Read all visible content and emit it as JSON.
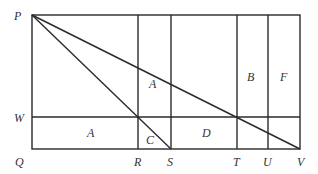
{
  "diagram": {
    "type": "geometry",
    "stroke_color": "#2a2a2a",
    "label_color": "#333333",
    "points": {
      "P": {
        "label": "P",
        "x": 32,
        "y": 15
      },
      "Q": {
        "label": "Q",
        "x": 32,
        "y": 149
      },
      "W": {
        "label": "W",
        "x": 32,
        "y": 117
      },
      "R": {
        "label": "R",
        "x": 138,
        "y": 149
      },
      "S": {
        "label": "S",
        "x": 171,
        "y": 149
      },
      "T": {
        "label": "T",
        "x": 237,
        "y": 149
      },
      "U": {
        "label": "U",
        "x": 268,
        "y": 149
      },
      "V": {
        "label": "V",
        "x": 300,
        "y": 149
      }
    },
    "region_labels": [
      {
        "label": "A",
        "x": 87,
        "y": 137
      },
      {
        "label": "A",
        "x": 152,
        "y": 87
      },
      {
        "label": "C",
        "x": 150,
        "y": 143
      },
      {
        "label": "D",
        "x": 206,
        "y": 137
      },
      {
        "label": "B",
        "x": 250,
        "y": 80
      },
      {
        "label": "F",
        "x": 283,
        "y": 80
      }
    ],
    "point_labels": [
      {
        "label": "P",
        "x": 14,
        "y": 20
      },
      {
        "label": "W",
        "x": 14,
        "y": 122
      },
      {
        "label": "Q",
        "x": 15,
        "y": 166
      },
      {
        "label": "R",
        "x": 134,
        "y": 166
      },
      {
        "label": "S",
        "x": 167,
        "y": 166
      },
      {
        "label": "T",
        "x": 233,
        "y": 166
      },
      {
        "label": "U",
        "x": 263,
        "y": 166
      },
      {
        "label": "V",
        "x": 297,
        "y": 166
      }
    ]
  }
}
